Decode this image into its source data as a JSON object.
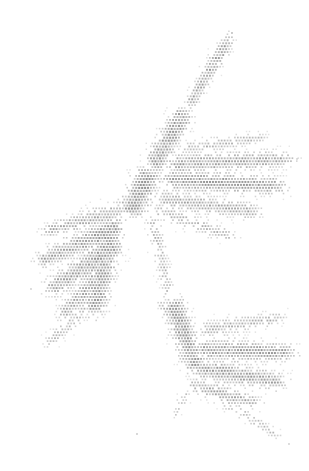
{
  "canvas": {
    "width": 309,
    "height": 471,
    "background": "#ffffff"
  },
  "chart_data": {
    "type": "scatter",
    "title": "",
    "subtitle": "",
    "xlabel": "",
    "ylabel": "",
    "legend": [],
    "annotations": [],
    "grid": false,
    "axes_visible": false,
    "tick_labels_x": [],
    "tick_labels_y": [],
    "xlim": [
      0,
      309
    ],
    "ylim": [
      0,
      471
    ],
    "marker": {
      "shape": "square",
      "size_px": 1.7,
      "pitch_px": 2.95,
      "color": "#8c8c8c",
      "min_opacity": 0.18,
      "max_opacity": 0.92
    },
    "description": "Dot-density distribution forming a branching diagonal delta pattern, densest along a NE-SW ridge with three lateral lobes (upper-right, mid-left, lower-right).",
    "point_count_estimate": 7100,
    "extent_px": {
      "left": 28,
      "right": 296,
      "top": 32,
      "bottom": 441
    },
    "density_field": {
      "note": "Parametric description of point density used to generate the scatter cloud. Each branch is a line segment in pixel space with a falloff half-width and a peak density weight (0-1).",
      "branches": [
        {
          "name": "main-ridge-upper",
          "x0": 231,
          "y0": 34,
          "x1": 186,
          "y1": 108,
          "half_width": 9,
          "weight": 0.82,
          "taper": 0.55
        },
        {
          "name": "main-ridge-mid",
          "x0": 186,
          "y0": 108,
          "x1": 150,
          "y1": 168,
          "half_width": 13,
          "weight": 0.95,
          "taper": 0.9
        },
        {
          "name": "main-ridge-lower",
          "x0": 150,
          "y0": 168,
          "x1": 128,
          "y1": 214,
          "half_width": 15,
          "weight": 1.0,
          "taper": 1.0
        },
        {
          "name": "spur-upper-right-a",
          "x0": 178,
          "y0": 148,
          "x1": 268,
          "y1": 136,
          "half_width": 8,
          "weight": 0.62,
          "taper": 0.5
        },
        {
          "name": "spur-upper-right-b",
          "x0": 162,
          "y0": 163,
          "x1": 296,
          "y1": 158,
          "half_width": 12,
          "weight": 0.8,
          "taper": 0.6
        },
        {
          "name": "spur-upper-right-c",
          "x0": 158,
          "y0": 178,
          "x1": 288,
          "y1": 186,
          "half_width": 13,
          "weight": 0.86,
          "taper": 0.65
        },
        {
          "name": "spur-upper-right-d",
          "x0": 152,
          "y0": 196,
          "x1": 262,
          "y1": 212,
          "half_width": 12,
          "weight": 0.74,
          "taper": 0.55
        },
        {
          "name": "spur-upper-right-e",
          "x0": 148,
          "y0": 206,
          "x1": 236,
          "y1": 238,
          "half_width": 10,
          "weight": 0.6,
          "taper": 0.5
        },
        {
          "name": "left-lobe-arm-a",
          "x0": 128,
          "y0": 206,
          "x1": 40,
          "y1": 232,
          "half_width": 11,
          "weight": 0.72,
          "taper": 0.6
        },
        {
          "name": "left-lobe-arm-b",
          "x0": 124,
          "y0": 222,
          "x1": 34,
          "y1": 262,
          "half_width": 13,
          "weight": 0.82,
          "taper": 0.7
        },
        {
          "name": "left-lobe-arm-c",
          "x0": 120,
          "y0": 240,
          "x1": 44,
          "y1": 292,
          "half_width": 14,
          "weight": 0.85,
          "taper": 0.75
        },
        {
          "name": "left-lobe-arm-d",
          "x0": 112,
          "y0": 258,
          "x1": 58,
          "y1": 318,
          "half_width": 12,
          "weight": 0.7,
          "taper": 0.6
        },
        {
          "name": "left-lobe-stem",
          "x0": 112,
          "y0": 216,
          "x1": 92,
          "y1": 316,
          "half_width": 16,
          "weight": 0.9,
          "taper": 0.85
        },
        {
          "name": "left-lobe-tail",
          "x0": 92,
          "y0": 300,
          "x1": 44,
          "y1": 346,
          "half_width": 10,
          "weight": 0.55,
          "taper": 0.45
        },
        {
          "name": "mid-descender",
          "x0": 150,
          "y0": 212,
          "x1": 170,
          "y1": 300,
          "half_width": 9,
          "weight": 0.6,
          "taper": 0.5
        },
        {
          "name": "lower-stem",
          "x0": 170,
          "y0": 296,
          "x1": 196,
          "y1": 372,
          "half_width": 14,
          "weight": 0.88,
          "taper": 0.8
        },
        {
          "name": "lower-lobe-arm-a",
          "x0": 196,
          "y0": 330,
          "x1": 286,
          "y1": 316,
          "half_width": 10,
          "weight": 0.66,
          "taper": 0.5
        },
        {
          "name": "lower-lobe-arm-b",
          "x0": 192,
          "y0": 348,
          "x1": 296,
          "y1": 352,
          "half_width": 13,
          "weight": 0.84,
          "taper": 0.65
        },
        {
          "name": "lower-lobe-arm-c",
          "x0": 190,
          "y0": 366,
          "x1": 286,
          "y1": 382,
          "half_width": 13,
          "weight": 0.86,
          "taper": 0.68
        },
        {
          "name": "lower-lobe-arm-d",
          "x0": 186,
          "y0": 382,
          "x1": 262,
          "y1": 404,
          "half_width": 11,
          "weight": 0.7,
          "taper": 0.55
        },
        {
          "name": "lower-left-arm",
          "x0": 190,
          "y0": 336,
          "x1": 158,
          "y1": 300,
          "half_width": 9,
          "weight": 0.58,
          "taper": 0.45
        },
        {
          "name": "lower-tail",
          "x0": 210,
          "y0": 392,
          "x1": 282,
          "y1": 438,
          "half_width": 8,
          "weight": 0.52,
          "taper": 0.4
        },
        {
          "name": "lower-foot",
          "x0": 186,
          "y0": 390,
          "x1": 174,
          "y1": 416,
          "half_width": 7,
          "weight": 0.45,
          "taper": 0.35
        }
      ],
      "outliers": [
        {
          "x": 136,
          "y": 433,
          "opacity": 0.35
        },
        {
          "x": 288,
          "y": 443,
          "opacity": 0.3
        },
        {
          "x": 231,
          "y": 32,
          "opacity": 0.45
        },
        {
          "x": 30,
          "y": 288,
          "opacity": 0.3
        },
        {
          "x": 296,
          "y": 158,
          "opacity": 0.28
        }
      ]
    }
  }
}
